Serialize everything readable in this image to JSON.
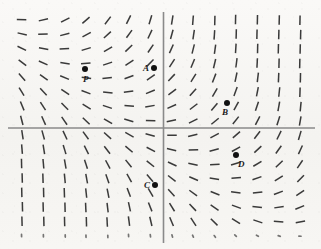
{
  "figure": {
    "background_color": "#f7f6f4",
    "axis_color": "#8a8a8a",
    "tick_color": "#262626",
    "point_color": "#111111"
  },
  "axes": {
    "origin_x": 163.5,
    "origin_y": 128,
    "x_axis": {
      "x1": 8,
      "y1": 128,
      "x2": 315,
      "y2": 128,
      "width": 1.6
    },
    "y_axis": {
      "x1": 163.5,
      "y1": 12,
      "x2": 163.5,
      "y2": 243,
      "width": 1.6
    }
  },
  "grid": {
    "x_start": 22,
    "x_step": 21.4,
    "x_count": 14,
    "y_start": 20,
    "y_step": 14.4,
    "y_count": 16,
    "segment_length": 9.5,
    "segment_width": 1.5
  },
  "chart_data": {
    "type": "scatter",
    "title": "",
    "xlabel": "",
    "ylabel": "",
    "grid": false,
    "legend": null,
    "labeled_points": [
      {
        "label": "P",
        "x": 85,
        "y": 69,
        "label_dx": -2,
        "label_dy": 6
      },
      {
        "label": "A",
        "x": 154,
        "y": 68,
        "label_dx": -11,
        "label_dy": -4
      },
      {
        "label": "B",
        "x": 227,
        "y": 103,
        "label_dx": -5,
        "label_dy": 5
      },
      {
        "label": "C",
        "x": 155,
        "y": 185,
        "label_dx": -11,
        "label_dy": -4
      },
      {
        "label": "D",
        "x": 236,
        "y": 155,
        "label_dx": 2,
        "label_dy": 5
      }
    ]
  }
}
